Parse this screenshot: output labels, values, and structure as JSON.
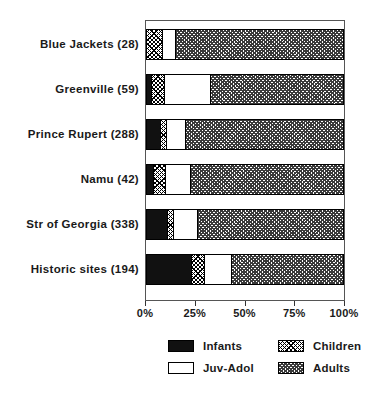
{
  "chart_data": {
    "type": "bar",
    "orientation": "horizontal",
    "stacked": true,
    "normalized": "percent",
    "title": "",
    "xlabel": "",
    "ylabel": "",
    "xlim": [
      0,
      100
    ],
    "grid": false,
    "legend_position": "bottom",
    "x_tick_labels": [
      "0%",
      "25%",
      "50%",
      "75%",
      "100%"
    ],
    "x_tick_values": [
      0,
      25,
      50,
      75,
      100
    ],
    "categories": [
      "Blue Jackets (28)",
      "Greenville (59)",
      "Prince Rupert (288)",
      "Namu (42)",
      "Str of Georgia (338)",
      "Historic sites (194)"
    ],
    "category_counts": [
      28,
      59,
      288,
      42,
      338,
      194
    ],
    "series": [
      {
        "name": "Infants",
        "pattern": "solid-black",
        "values": [
          0.0,
          2.5,
          7.0,
          3.5,
          10.5,
          22.5
        ]
      },
      {
        "name": "Children",
        "pattern": "light-crosshatch",
        "values": [
          8.0,
          6.5,
          3.0,
          6.0,
          3.0,
          7.0
        ]
      },
      {
        "name": "Juv-Adol",
        "pattern": "white",
        "values": [
          6.5,
          23.5,
          9.5,
          12.5,
          12.5,
          13.5
        ]
      },
      {
        "name": "Adults",
        "pattern": "dark-crosshatch",
        "values": [
          85.5,
          67.5,
          80.5,
          78.0,
          74.0,
          57.0
        ]
      }
    ],
    "legend_entries": [
      {
        "label": "Infants",
        "pattern": "solid-black"
      },
      {
        "label": "Children",
        "pattern": "light-crosshatch"
      },
      {
        "label": "Juv-Adol",
        "pattern": "white"
      },
      {
        "label": "Adults",
        "pattern": "dark-crosshatch"
      }
    ],
    "colors": {
      "infants": "#111111",
      "children_fill": "#ffffff",
      "children_hatch": "#000000",
      "juv_adol": "#ffffff",
      "adults_hatch": "#3a3a3a",
      "frame": "#555555",
      "text": "#1a1a1a",
      "background": "#ffffff"
    }
  }
}
